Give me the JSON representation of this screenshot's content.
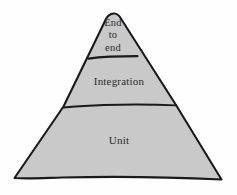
{
  "diagram": {
    "type": "pyramid",
    "orientation": "apex-up",
    "fill_color": "#c9c9c9",
    "stroke_color": "#1a1a1a",
    "text_color": "#2b2b2b",
    "background_color": "#fefefe",
    "tiers": [
      {
        "id": "end-to-end",
        "position": "top",
        "label": "End\nto\nend",
        "label_lines": [
          "End",
          "to",
          "end"
        ]
      },
      {
        "id": "integration",
        "position": "middle",
        "label": "Integration",
        "label_lines": [
          "Integration"
        ]
      },
      {
        "id": "unit",
        "position": "bottom",
        "label": "Unit",
        "label_lines": [
          "Unit"
        ]
      }
    ]
  }
}
